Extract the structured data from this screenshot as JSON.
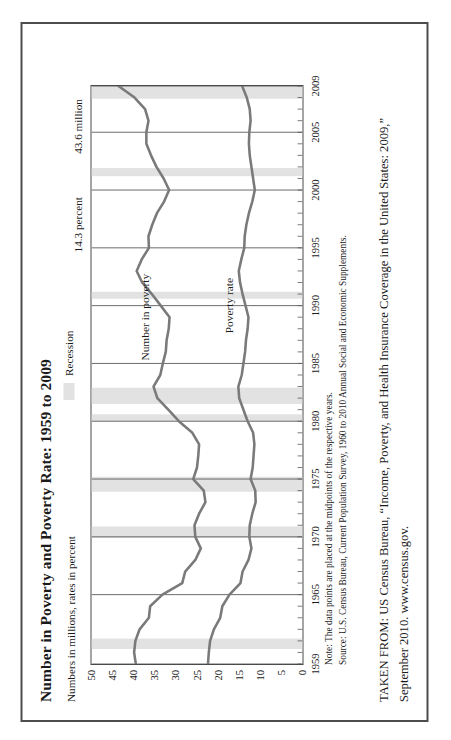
{
  "figure": {
    "title": "Number in Poverty and Poverty Rate: 1959 to 2009",
    "subtitle": "Numbers in millions, rates in percent",
    "legend_label": "Recession",
    "legend_swatch_color": "#e2e2e2",
    "note": "Note: The data points are placed at the midpoints of the respective years.",
    "source": "Source: U.S. Census Bureau, Current Population Survey, 1960 to 2010 Annual Social and Economic Supplements.",
    "taken_from_line1": "TAKEN FROM: US Census Bureau, “Income, Poverty, and Health Insurance Coverage in the United States: 2009,”",
    "taken_from_line2": "September 2010. www.census.gov."
  },
  "chart_data": {
    "type": "line",
    "title": "Number in Poverty and Poverty Rate: 1959 to 2009",
    "subtitle": "Numbers in millions, rates in percent",
    "xlabel": "",
    "ylabel": "Numbers in millions, rates in percent",
    "xlim": [
      1959,
      2009
    ],
    "ylim": [
      0,
      50
    ],
    "ytick_labels": [
      "0",
      "5",
      "10",
      "15",
      "20",
      "25",
      "30",
      "35",
      "40",
      "45",
      "50"
    ],
    "yticks": [
      0,
      5,
      10,
      15,
      20,
      25,
      30,
      35,
      40,
      45,
      50
    ],
    "xtick_labels": [
      "1959",
      "1965",
      "1970",
      "1975",
      "1980",
      "1985",
      "1990",
      "1995",
      "2000",
      "2005",
      "2009"
    ],
    "xticks": [
      1959,
      1965,
      1970,
      1975,
      1980,
      1985,
      1990,
      1995,
      2000,
      2005,
      2009
    ],
    "minor_xtick_interval": 1,
    "grid": "vertical-major-only",
    "legend_position": "top-right",
    "line_color": "#7a7a7a",
    "grid_color": "#5a5a5a",
    "recession_band_color": "#e2e2e2",
    "annotations": [
      {
        "text": "43.6 million",
        "series": "Number in poverty",
        "x": 2009,
        "y": 43.6
      },
      {
        "text": "14.3 percent",
        "series": "Poverty rate",
        "x": 2009,
        "y": 14.3
      },
      {
        "text": "Number in poverty",
        "type": "series-label",
        "x": 1989,
        "y": 37.5
      },
      {
        "text": "Poverty rate",
        "type": "series-label",
        "x": 1990,
        "y": 17.5
      }
    ],
    "recessions": [
      {
        "start": 1960.3,
        "end": 1961.2
      },
      {
        "start": 1969.9,
        "end": 1970.9
      },
      {
        "start": 1973.9,
        "end": 1975.2
      },
      {
        "start": 1980.0,
        "end": 1980.6
      },
      {
        "start": 1981.5,
        "end": 1982.9
      },
      {
        "start": 1990.6,
        "end": 1991.2
      },
      {
        "start": 2001.2,
        "end": 2001.9
      },
      {
        "start": 2007.9,
        "end": 2009.5
      }
    ],
    "x": [
      1959,
      1960,
      1961,
      1962,
      1963,
      1964,
      1965,
      1966,
      1967,
      1968,
      1969,
      1970,
      1971,
      1972,
      1973,
      1974,
      1975,
      1976,
      1977,
      1978,
      1979,
      1980,
      1981,
      1982,
      1983,
      1984,
      1985,
      1986,
      1987,
      1988,
      1989,
      1990,
      1991,
      1992,
      1993,
      1994,
      1995,
      1996,
      1997,
      1998,
      1999,
      2000,
      2001,
      2002,
      2003,
      2004,
      2005,
      2006,
      2007,
      2008,
      2009
    ],
    "series": [
      {
        "name": "Number in poverty",
        "units": "millions",
        "values": [
          39.5,
          39.9,
          39.6,
          38.6,
          36.4,
          36.1,
          33.2,
          28.5,
          27.8,
          25.4,
          24.1,
          25.4,
          25.6,
          24.5,
          23.0,
          23.4,
          25.9,
          25.0,
          24.7,
          24.5,
          26.1,
          29.3,
          31.8,
          34.4,
          35.3,
          33.7,
          33.1,
          32.4,
          32.2,
          31.7,
          31.5,
          33.6,
          35.7,
          38.0,
          39.3,
          38.1,
          36.4,
          36.5,
          35.6,
          34.5,
          32.8,
          31.6,
          32.9,
          34.6,
          35.9,
          37.0,
          37.0,
          36.5,
          37.3,
          39.8,
          43.6
        ]
      },
      {
        "name": "Poverty rate",
        "units": "percent",
        "values": [
          22.4,
          22.2,
          21.9,
          21.0,
          19.5,
          19.0,
          17.3,
          14.7,
          14.2,
          12.8,
          12.1,
          12.6,
          12.5,
          11.9,
          11.1,
          11.2,
          12.3,
          11.8,
          11.6,
          11.4,
          11.7,
          13.0,
          14.0,
          15.0,
          15.2,
          14.4,
          14.0,
          13.6,
          13.4,
          13.0,
          12.8,
          13.5,
          14.2,
          14.8,
          15.1,
          14.5,
          13.8,
          13.7,
          13.3,
          12.7,
          11.9,
          11.3,
          11.7,
          12.1,
          12.5,
          12.7,
          12.6,
          12.3,
          12.5,
          13.2,
          14.3
        ]
      }
    ]
  }
}
